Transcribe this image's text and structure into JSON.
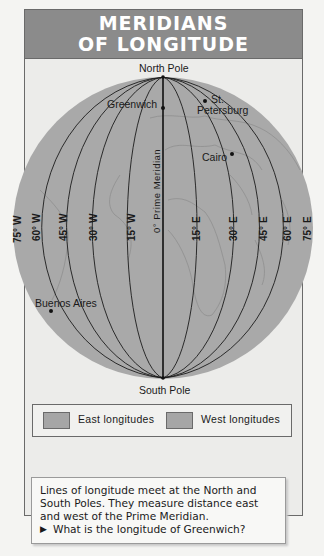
{
  "title": {
    "line1": "MERIDIANS",
    "line2": "OF LONGITUDE"
  },
  "poles": {
    "north": "North Pole",
    "south": "South Pole"
  },
  "prime_meridian_label": "0°  Prime Meridian",
  "meridians": {
    "west": [
      "75° W",
      "60° W",
      "45° W",
      "30° W",
      "15° W"
    ],
    "east": [
      "15° E",
      "30° E",
      "45° E",
      "60° E",
      "75° E"
    ]
  },
  "cities": [
    {
      "name": "Greenwich"
    },
    {
      "name_line1": "St.",
      "name_line2": "Petersburg"
    },
    {
      "name": "Cairo"
    },
    {
      "name": "Buenos Aires"
    }
  ],
  "legend": {
    "items": [
      {
        "label": "East longitudes",
        "color": "#a6a6a6"
      },
      {
        "label": "West longitudes",
        "color": "#a6a6a6"
      }
    ]
  },
  "caption": {
    "text": "Lines of longitude meet at the North and South Poles. They measure distance east and west of the Prime Meridian.",
    "question_marker": "▶",
    "question": "What is the longitude of Greenwich?"
  },
  "colors": {
    "globe": "#a9a9a9",
    "header": "#8b8b8b",
    "background": "#ececea"
  }
}
